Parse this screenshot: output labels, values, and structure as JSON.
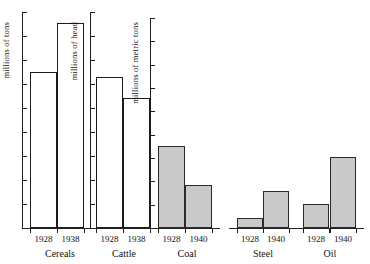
{
  "figure": {
    "background": "#ffffff",
    "bar_open_fill": "#ffffff",
    "bar_filled_fill": "#c9c9c9",
    "axis_color": "#1d1d1d"
  },
  "chart_data": {
    "type": "bar",
    "title": "",
    "xlabel": "",
    "grid": false,
    "legend": "none",
    "panels": [
      {
        "name": "Cereals",
        "ylabel": "millions of tons",
        "categories": [
          "1928",
          "1938"
        ],
        "values": [
          0.72,
          0.95
        ],
        "bar_style": "open",
        "axis_ticks": 9,
        "ylim": [
          0,
          1
        ]
      },
      {
        "name": "Cattle",
        "ylabel": "millions of head",
        "categories": [
          "1928",
          "1938"
        ],
        "values": [
          0.7,
          0.6
        ],
        "bar_style": "open",
        "axis_ticks": 9,
        "ylim": [
          0,
          1
        ]
      },
      {
        "name": "Coal",
        "ylabel": "millions of metric tons",
        "categories": [
          "1928",
          "1940"
        ],
        "values": [
          0.38,
          0.2
        ],
        "bar_style": "filled",
        "axis_ticks": 9,
        "ylim": [
          0,
          1
        ]
      },
      {
        "name": "Steel",
        "ylabel": "",
        "categories": [
          "1928",
          "1940"
        ],
        "values": [
          0.045,
          0.17
        ],
        "bar_style": "filled",
        "axis_ticks": 0,
        "ylim": [
          0,
          1
        ]
      },
      {
        "name": "Oil",
        "ylabel": "",
        "categories": [
          "1928",
          "1940"
        ],
        "values": [
          0.11,
          0.33
        ],
        "bar_style": "filled",
        "axis_ticks": 0,
        "ylim": [
          0,
          1
        ]
      }
    ]
  }
}
